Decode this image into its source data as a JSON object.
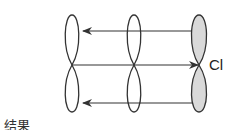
{
  "diagram": {
    "atom_label": "Cl",
    "caption_partial": "结果",
    "colors": {
      "stroke": "#333333",
      "cl_fill": "#d9d9d9",
      "carbon_fill": "#ffffff"
    },
    "orbitals": [
      {
        "id": "p1",
        "cx": 72,
        "filled": false
      },
      {
        "id": "p2",
        "cx": 134,
        "filled": false
      },
      {
        "id": "p3-cl",
        "cx": 199,
        "filled": true
      }
    ],
    "arrows": [
      {
        "from": "p3-cl",
        "to": "p1",
        "y": 31,
        "direction": "left"
      },
      {
        "from": "p1",
        "to": "p3-cl",
        "y": 65,
        "direction": "right"
      },
      {
        "from": "p3-cl",
        "to": "p1",
        "y": 103,
        "direction": "left"
      }
    ]
  }
}
